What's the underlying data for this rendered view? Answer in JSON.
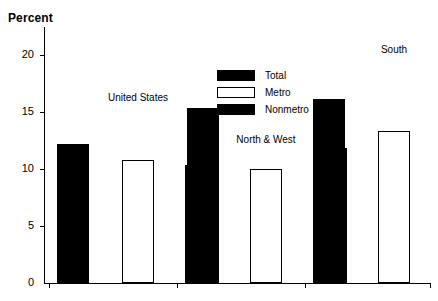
{
  "chart_data": {
    "type": "bar",
    "title": "",
    "ylabel": "Percent",
    "xlabel": "",
    "ylim": [
      0,
      22.5
    ],
    "yticks": [
      0,
      5,
      10,
      15,
      20
    ],
    "ytick_labels": [
      "0",
      "5",
      "10",
      "15",
      "20"
    ],
    "grid": false,
    "legend_position": "upper center",
    "categories": [
      "United States",
      "North & West",
      "South"
    ],
    "series": [
      {
        "name": "Total",
        "fill": "solid",
        "values": [
          12.2,
          10.4,
          16.2
        ]
      },
      {
        "name": "Metro",
        "fill": "open",
        "values": [
          10.8,
          10.0,
          13.4
        ]
      },
      {
        "name": "Nonmetro",
        "fill": "solid",
        "values": [
          15.4,
          11.9,
          20.2
        ]
      }
    ],
    "legend": [
      {
        "label": "Total",
        "fill": "solid"
      },
      {
        "label": "Metro",
        "fill": "open"
      },
      {
        "label": "Nonmetro",
        "fill": "solid"
      }
    ]
  }
}
